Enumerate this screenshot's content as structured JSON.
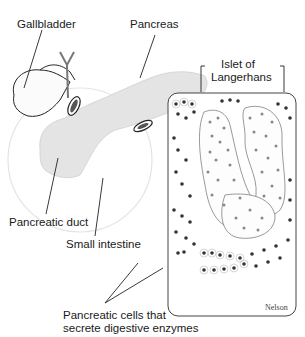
{
  "diagram": {
    "labels": {
      "gallbladder": "Gallbladder",
      "pancreas": "Pancreas",
      "islet_line1": "Islet of",
      "islet_line2": "Langerhans",
      "pancreatic_duct": "Pancreatic duct",
      "small_intestine": "Small intestine",
      "acinar_line1": "Pancreatic cells that",
      "acinar_line2": "secrete digestive enzymes"
    },
    "credit": "Nelson",
    "colors": {
      "line": "#1a1a1a",
      "organ_fill": "#e6e6e6",
      "cell_nucleus": "#555555",
      "cell_fill": "#f4f4f4"
    }
  }
}
